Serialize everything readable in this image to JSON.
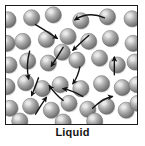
{
  "figure": {
    "label": "Liquid",
    "caption_label": "Liquid",
    "box": {
      "border_color": "#1a1a1a",
      "fill_color": "#ffffff",
      "x": 5,
      "y": 5,
      "width": 133,
      "height": 120
    },
    "particle": {
      "radius": 8.2,
      "base_color": "#8e8e8e",
      "highlight_color": "#e9e9e9",
      "shadow_color": "#5a5a5a",
      "outline_color": "#6b6b6b",
      "count": 40
    },
    "arrow": {
      "color": "#111111",
      "width": 1.4,
      "count": 12
    }
  },
  "chart_data": {
    "type": "scatter",
    "title": "Liquid",
    "xlabel": "",
    "ylabel": "",
    "xlim": [
      0,
      133
    ],
    "ylim": [
      0,
      120
    ],
    "grid": false,
    "legend": "none",
    "particles": [
      {
        "x": 2,
        "y": 14
      },
      {
        "x": 26,
        "y": 12
      },
      {
        "x": 48,
        "y": 9
      },
      {
        "x": 76,
        "y": 15
      },
      {
        "x": 103,
        "y": 11
      },
      {
        "x": 128,
        "y": 13
      },
      {
        "x": 1,
        "y": 38
      },
      {
        "x": 17,
        "y": 36
      },
      {
        "x": 41,
        "y": 34
      },
      {
        "x": 63,
        "y": 31
      },
      {
        "x": 84,
        "y": 36
      },
      {
        "x": 106,
        "y": 33
      },
      {
        "x": 129,
        "y": 38
      },
      {
        "x": 3,
        "y": 60
      },
      {
        "x": 22,
        "y": 56
      },
      {
        "x": 43,
        "y": 58
      },
      {
        "x": 57,
        "y": 47
      },
      {
        "x": 72,
        "y": 55
      },
      {
        "x": 95,
        "y": 53
      },
      {
        "x": 113,
        "y": 60
      },
      {
        "x": 131,
        "y": 57
      },
      {
        "x": 1,
        "y": 82
      },
      {
        "x": 20,
        "y": 78
      },
      {
        "x": 37,
        "y": 84
      },
      {
        "x": 55,
        "y": 80
      },
      {
        "x": 76,
        "y": 84
      },
      {
        "x": 97,
        "y": 79
      },
      {
        "x": 118,
        "y": 83
      },
      {
        "x": 133,
        "y": 80
      },
      {
        "x": 4,
        "y": 104
      },
      {
        "x": 25,
        "y": 102
      },
      {
        "x": 46,
        "y": 106
      },
      {
        "x": 64,
        "y": 99
      },
      {
        "x": 83,
        "y": 105
      },
      {
        "x": 102,
        "y": 102
      },
      {
        "x": 122,
        "y": 106
      },
      {
        "x": 134,
        "y": 99
      },
      {
        "x": 14,
        "y": 117
      },
      {
        "x": 58,
        "y": 118
      },
      {
        "x": 90,
        "y": 117
      }
    ],
    "arrows": [
      {
        "path": "M 30 19 Q 42 26 52 33",
        "type": "straight"
      },
      {
        "path": "M 100 12 Q 84 5 70 14",
        "type": "curved"
      },
      {
        "path": "M 84 30 Q 76 37 68 45",
        "type": "straight"
      },
      {
        "path": "M 24 46 Q 20 60 23 74",
        "type": "curved"
      },
      {
        "path": "M 58 42 Q 52 52 46 61",
        "type": "straight"
      },
      {
        "path": "M 110 70 Q 110 62 110 52",
        "type": "straight"
      },
      {
        "path": "M 75 62 Q 73 72 68 79",
        "type": "straight"
      },
      {
        "path": "M 33 73 Q 30 82 26 91",
        "type": "straight"
      },
      {
        "path": "M 58 96 Q 50 90 44 81",
        "type": "curved"
      },
      {
        "path": "M 78 92 Q 68 86 58 84",
        "type": "curved"
      },
      {
        "path": "M 30 110 Q 36 100 41 93",
        "type": "curved"
      },
      {
        "path": "M 88 104 Q 98 94 108 92",
        "type": "curved"
      }
    ]
  }
}
